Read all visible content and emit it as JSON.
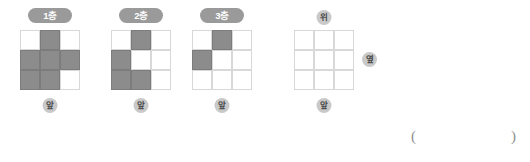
{
  "worksheet": {
    "fill_color": "#8c8c8c",
    "grid_line_color": "#d8d8d8",
    "badge_color": "#9a9a9a",
    "chip_color": "#c9c9c9"
  },
  "figures": [
    {
      "id": "floor-1",
      "badge": "1층",
      "front_label": "앞",
      "grid": [
        [
          0,
          1,
          0
        ],
        [
          1,
          1,
          1
        ],
        [
          1,
          1,
          0
        ]
      ],
      "left": 20,
      "grid_top": 30
    },
    {
      "id": "floor-2",
      "badge": "2층",
      "front_label": "앞",
      "grid": [
        [
          0,
          1,
          0
        ],
        [
          1,
          0,
          0
        ],
        [
          1,
          1,
          0
        ]
      ],
      "left": 111,
      "grid_top": 30
    },
    {
      "id": "floor-3",
      "badge": "3층",
      "front_label": "앞",
      "grid": [
        [
          0,
          1,
          0
        ],
        [
          1,
          0,
          0
        ],
        [
          0,
          0,
          0
        ]
      ],
      "left": 192,
      "grid_top": 30
    },
    {
      "id": "answer-grid",
      "badge": null,
      "top_label": "위",
      "side_label": "옆",
      "front_label": "앞",
      "grid": [
        [
          0,
          0,
          0
        ],
        [
          0,
          0,
          0
        ],
        [
          0,
          0,
          0
        ]
      ],
      "left": 294,
      "grid_top": 30
    }
  ],
  "answer_blank": {
    "open_paren": "(",
    "close_paren": ")"
  }
}
